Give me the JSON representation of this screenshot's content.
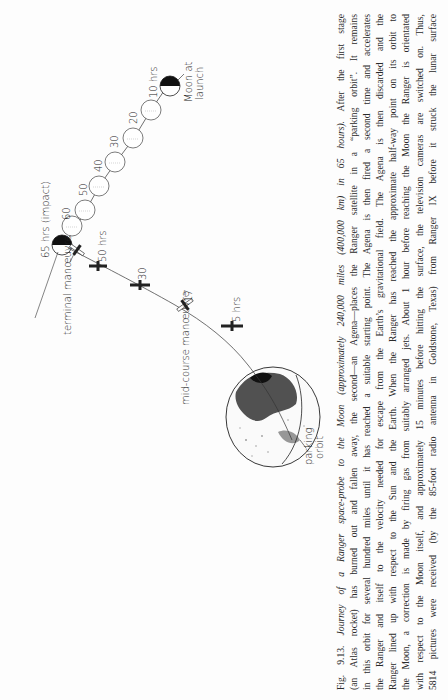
{
  "figure": {
    "number": "Fig. 9.13.",
    "title_italic": "Journey of a Ranger space-probe to the Moon (approximately 240,000 miles (400,000 km) in 65 hours).",
    "caption_lines": [
      {
        "italic": "Journey of a Ranger space-probe to the Moon (approximately 240,000 miles (400,000 km) in 65 hours).",
        "prefix": "Fig. 9.13. ",
        "rest": " After the first stage"
      },
      {
        "text": "(an Atlas rocket) has burned out and fallen away, the second—an Agena—places the Ranger satellite in a “parking orbit”. It remains"
      },
      {
        "text": "in this orbit for several hundred miles until it has reached a suitable starting point. The Agena is then fired a second time and accelerates"
      },
      {
        "text": "the Ranger and itself to the velocity needed for escape from the Earth’s gravitational field. The Agena is then discarded and the"
      },
      {
        "text": "Ranger lined up with respect to the Sun and the Earth. When the Ranger has reached the approximate half-way point on its orbit to"
      },
      {
        "text": "the Moon, a correction is made by firing gas from suitably arranged jets. About 1 hour before reaching the Moon the Ranger is orientated"
      },
      {
        "text": "with respect to the Moon itself, and approximately 15 minutes before hitting the surface, the television cameras are switched on. Thus,"
      },
      {
        "text": "5814 pictures were received (by the 85-foot radio antenna in Goldstone, Texas) from Ranger IX before it struck the lunar surface"
      }
    ]
  },
  "diagram": {
    "labels": {
      "moon_at_launch": [
        "Moon at",
        "launch"
      ],
      "moon_10": "10 hrs",
      "moon_20": "20",
      "moon_30": "30",
      "moon_40": "40",
      "moon_50": "50",
      "moon_60": "60",
      "moon_65": "65 hrs (impact)",
      "probe_50": "50 hrs",
      "probe_30": "30",
      "probe_17": "17",
      "probe_5": "5 hrs",
      "terminal_manoeuvre": "terminal manœuvre",
      "mid_course_manoeuvre": "mid-course manœuvre",
      "parking_orbit": [
        "parking",
        "orbit"
      ]
    },
    "moon_positions_hrs": [
      0,
      10,
      20,
      30,
      40,
      50,
      60,
      65
    ],
    "probe_positions_hrs": [
      5,
      17,
      30,
      50,
      65
    ],
    "colors": {
      "ink": "#222222",
      "paper": "#fdfdfd"
    }
  }
}
